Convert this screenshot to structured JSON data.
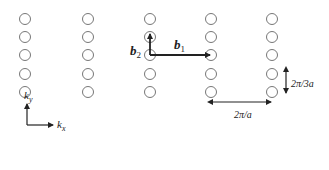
{
  "diagram": {
    "type": "reciprocal-lattice",
    "lattice": {
      "columns_x": [
        25,
        88,
        150,
        211,
        272
      ],
      "rows_y": [
        19,
        37,
        55,
        74,
        92
      ],
      "point_radius": 5.5,
      "point_color": "#777777"
    },
    "vectors": {
      "b1": {
        "label_main": "b",
        "label_sub": "1",
        "from": [
          150,
          55
        ],
        "to": [
          211,
          55
        ]
      },
      "b2": {
        "label_main": "b",
        "label_sub": "2",
        "from": [
          150,
          55
        ],
        "to": [
          150,
          35
        ]
      }
    },
    "dimensions": {
      "horizontal": {
        "label": "2π/a"
      },
      "vertical": {
        "label": "2π/3a"
      }
    },
    "axes": {
      "ky": {
        "label_main": "k",
        "label_sub": "y"
      },
      "kx": {
        "label_main": "k",
        "label_sub": "x"
      }
    }
  }
}
